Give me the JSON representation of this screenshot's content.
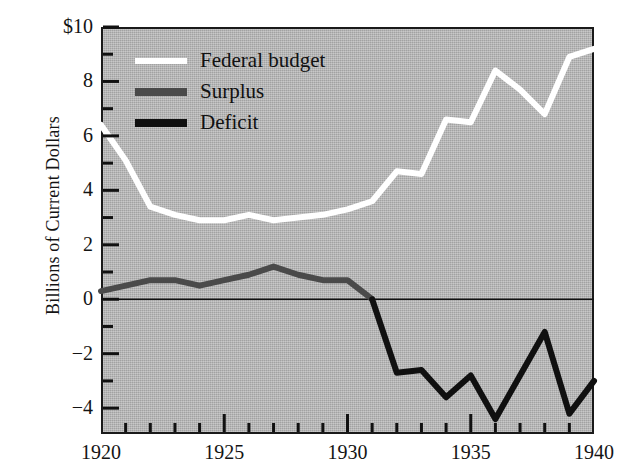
{
  "chart_data": {
    "type": "line",
    "title": "",
    "xlabel": "",
    "ylabel": "Billions of Current Dollars",
    "x": [
      1920,
      1921,
      1922,
      1923,
      1924,
      1925,
      1926,
      1927,
      1928,
      1929,
      1930,
      1931,
      1932,
      1933,
      1934,
      1935,
      1936,
      1937,
      1938,
      1939,
      1940
    ],
    "xlim": [
      1920,
      1940
    ],
    "ylim": [
      -4.95,
      10
    ],
    "grid": false,
    "legend_position": "upper-left-inside",
    "x_ticks": [
      {
        "value": 1920,
        "label": "1920"
      },
      {
        "value": 1925,
        "label": "1925"
      },
      {
        "value": 1930,
        "label": "1930"
      },
      {
        "value": 1935,
        "label": "1935"
      },
      {
        "value": 1940,
        "label": "1940"
      }
    ],
    "x_minor_ticks": [
      1921,
      1922,
      1923,
      1924,
      1926,
      1927,
      1928,
      1929,
      1931,
      1932,
      1933,
      1934,
      1936,
      1937,
      1938,
      1939
    ],
    "y_ticks": [
      {
        "value": 10,
        "label": "$10"
      },
      {
        "value": 8,
        "label": "8"
      },
      {
        "value": 6,
        "label": "6"
      },
      {
        "value": 4,
        "label": "4"
      },
      {
        "value": 2,
        "label": "2"
      },
      {
        "value": 0,
        "label": "0"
      },
      {
        "value": -2,
        "label": "−2"
      },
      {
        "value": -4,
        "label": "−4"
      }
    ],
    "y_minor_ticks": [
      9,
      7,
      5,
      3,
      1,
      -1,
      -3
    ],
    "zero_line": 0,
    "series": [
      {
        "name": "Federal budget",
        "color": "#ffffff",
        "x": [
          1920,
          1921,
          1922,
          1923,
          1924,
          1925,
          1926,
          1927,
          1928,
          1929,
          1930,
          1931,
          1932,
          1933,
          1934,
          1935,
          1936,
          1937,
          1938,
          1939,
          1940
        ],
        "values": [
          6.4,
          5.1,
          3.4,
          3.1,
          2.9,
          2.9,
          3.1,
          2.9,
          3.0,
          3.1,
          3.3,
          3.6,
          4.7,
          4.6,
          6.6,
          6.5,
          8.4,
          7.7,
          6.8,
          8.9,
          9.2
        ]
      },
      {
        "name": "Surplus",
        "color": "#4a4a4a",
        "x": [
          1920,
          1921,
          1922,
          1923,
          1924,
          1925,
          1926,
          1927,
          1928,
          1929,
          1930,
          1931
        ],
        "values": [
          0.3,
          0.5,
          0.7,
          0.7,
          0.5,
          0.7,
          0.9,
          1.2,
          0.9,
          0.7,
          0.7,
          0.0
        ]
      },
      {
        "name": "Deficit",
        "color": "#101010",
        "x": [
          1931,
          1932,
          1933,
          1934,
          1935,
          1936,
          1937,
          1938,
          1939,
          1940
        ],
        "values": [
          0.0,
          -2.7,
          -2.6,
          -3.6,
          -2.8,
          -4.4,
          -2.8,
          -1.2,
          -4.2,
          -3.0
        ]
      }
    ]
  },
  "legend": {
    "items": [
      {
        "label": "Federal budget",
        "color": "#ffffff",
        "swatch_height": 6
      },
      {
        "label": "Surplus",
        "color": "#4a4a4a",
        "swatch_height": 8
      },
      {
        "label": "Deficit",
        "color": "#101010",
        "swatch_height": 8
      }
    ]
  },
  "axis": {
    "y_title": "Billions of Current Dollars"
  }
}
